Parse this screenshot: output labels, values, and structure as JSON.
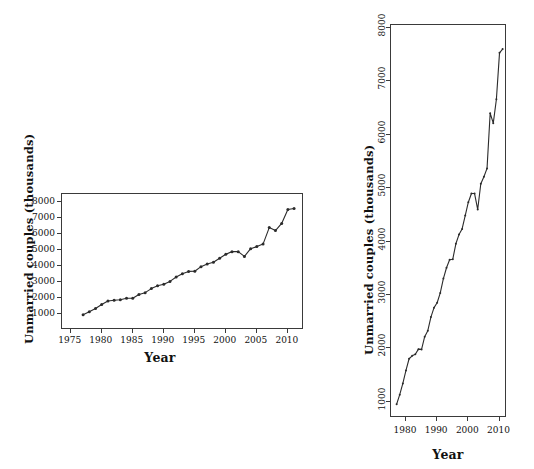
{
  "figure": {
    "background": "#ffffff",
    "ink_color": "#2b2b2b"
  },
  "panels": [
    {
      "id": "left-panel",
      "name": "wide-aspect-panel",
      "xlabel": "Year",
      "ylabel": "Unmarried couples (thousands)",
      "x_ticks": [
        "1975",
        "1980",
        "1985",
        "1990",
        "1995",
        "2000",
        "2005",
        "2010"
      ],
      "y_ticks": [
        "1000",
        "2000",
        "3000",
        "4000",
        "5000",
        "6000",
        "7000",
        "8000"
      ],
      "xlim": [
        1973.6,
        2012.6
      ],
      "ylim": [
        0,
        8500
      ]
    },
    {
      "id": "right-panel",
      "name": "tall-aspect-panel",
      "xlabel": "Year",
      "ylabel": "Unmarried couples (thousands)",
      "x_ticks": [
        "1980",
        "1990",
        "2000",
        "2010"
      ],
      "y_ticks": [
        "1000",
        "2000",
        "3000",
        "4000",
        "5000",
        "6000",
        "7000",
        "8000"
      ],
      "xlim": [
        1975.2,
        2012.4
      ],
      "ylim": [
        700,
        8050
      ]
    }
  ],
  "chart_data": {
    "type": "line",
    "title": "",
    "subtitle": "",
    "xlabel": "Year",
    "ylabel": "Unmarried couples (thousands)",
    "grid": false,
    "legend": null,
    "marker": "filled-circle",
    "note": "Same series drawn twice at different aspect ratios (aspect-ratio banking comparison).",
    "x": [
      1977,
      1978,
      1979,
      1980,
      1981,
      1982,
      1983,
      1984,
      1985,
      1986,
      1987,
      1988,
      1989,
      1990,
      1991,
      1992,
      1993,
      1994,
      1995,
      1996,
      1997,
      1998,
      1999,
      2000,
      2001,
      2002,
      2003,
      2004,
      2005,
      2006,
      2007,
      2008,
      2009,
      2010,
      2011
    ],
    "series": [
      {
        "name": "Unmarried couples",
        "values": [
          957,
          1137,
          1346,
          1589,
          1808,
          1863,
          1891,
          1988,
          1983,
          2220,
          2334,
          2588,
          2764,
          2856,
          3039,
          3308,
          3510,
          3661,
          3668,
          3958,
          4130,
          4236,
          4486,
          4736,
          4898,
          4898,
          4600,
          5080,
          5212,
          5368,
          6400,
          6214,
          6661,
          7529,
          7599
        ]
      }
    ],
    "x_axis_range": [
      1973.6,
      2012.6
    ],
    "y_axis_range": [
      0,
      8500
    ]
  }
}
